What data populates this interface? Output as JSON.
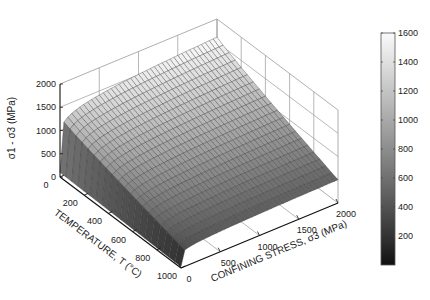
{
  "chart_data": {
    "type": "surface3d",
    "title": "",
    "xlabel": "TEMPERATURE, T (°C)",
    "ylabel": "CONFINING STRESS, σ3 (MPa)",
    "zlabel": "σ1 - σ3 (MPa)",
    "x_axis": {
      "name": "temperature",
      "unit": "°C",
      "range": [
        0,
        1000
      ],
      "ticks": [
        0,
        200,
        400,
        600,
        800,
        1000
      ]
    },
    "y_axis": {
      "name": "confining_stress",
      "unit": "MPa",
      "range": [
        0,
        2000
      ],
      "ticks": [
        0,
        500,
        1000,
        1500,
        2000
      ]
    },
    "z_axis": {
      "name": "differential_stress",
      "unit": "MPa",
      "range": [
        0,
        2000
      ],
      "ticks": [
        0,
        500,
        1000,
        1500,
        2000
      ]
    },
    "grid": true,
    "colormap": "gray",
    "colorbar": {
      "range": [
        0,
        1600
      ],
      "ticks": [
        200,
        400,
        600,
        800,
        1000,
        1200,
        1400,
        1600
      ],
      "position": "right"
    },
    "surface_samples": {
      "description": "Approximate σ1-σ3 values read from surface edges",
      "points": [
        {
          "T": 0,
          "sigma3": 0,
          "value": 100
        },
        {
          "T": 0,
          "sigma3": 500,
          "value": 1420
        },
        {
          "T": 0,
          "sigma3": 2000,
          "value": 1610
        },
        {
          "T": 1000,
          "sigma3": 0,
          "value": 30
        },
        {
          "T": 1000,
          "sigma3": 2000,
          "value": 500
        }
      ]
    },
    "model": {
      "z0_T0": 100,
      "zmax_T0": 1610,
      "z0_T1000": 30,
      "zmax_T1000": 500,
      "exponent": 0.1
    }
  },
  "labels": {
    "z_ticks": [
      "0",
      "500",
      "1000",
      "1500",
      "2000"
    ],
    "x_ticks": [
      "0",
      "200",
      "400",
      "600",
      "800",
      "1000"
    ],
    "y_ticks": [
      "0",
      "500",
      "1000",
      "1500",
      "2000"
    ],
    "cb_ticks": [
      "200",
      "400",
      "600",
      "800",
      "1000",
      "1200",
      "1400",
      "1600"
    ]
  }
}
